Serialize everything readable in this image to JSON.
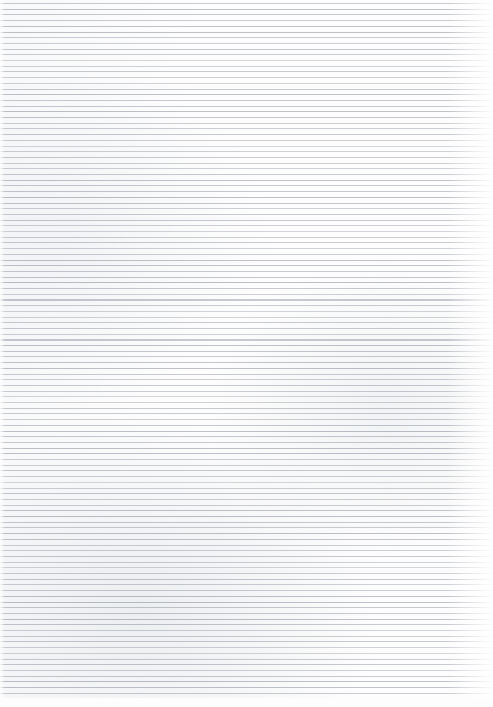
{
  "document": {
    "type": "scanned-image",
    "subject": "blank ruled paper",
    "title": "Blank Ruled Paper Scan",
    "has_text": false,
    "has_handwriting": false,
    "has_margin_rule": false,
    "orientation": "portrait",
    "width_px": 493,
    "height_px": 707
  },
  "paper": {
    "background_color": "#fdfdfd",
    "page_color": "#ffffff",
    "texture": "faint scan shading, light smudges near lower-left and mid-right"
  },
  "ruling": {
    "style": "narrow-ruled horizontal lines",
    "line_color": "#b4b8c0",
    "line_thickness_px": 1,
    "line_pitch_px": 5.7,
    "line_count": 122,
    "first_line_y_px": 3,
    "last_line_y_px": 697,
    "left_inset_px": 0,
    "right_inset_px": 0,
    "top_margin_px": 3,
    "bottom_margin_px": 9,
    "right_edge_fade": true,
    "left_edge_fade": true
  },
  "content": {
    "text_blocks": [],
    "annotations": [],
    "note": "No visible text, figures, headings or markings on the sheet."
  }
}
